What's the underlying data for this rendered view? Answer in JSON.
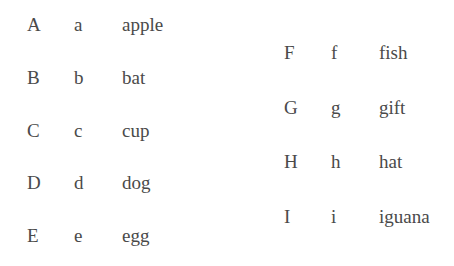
{
  "columns": [
    {
      "rows": [
        {
          "upper": "A",
          "lower": "a",
          "word": "apple"
        },
        {
          "upper": "B",
          "lower": "b",
          "word": "bat"
        },
        {
          "upper": "C",
          "lower": "c",
          "word": "cup"
        },
        {
          "upper": "D",
          "lower": "d",
          "word": "dog"
        },
        {
          "upper": "E",
          "lower": "e",
          "word": "egg"
        }
      ]
    },
    {
      "rows": [
        {
          "upper": "F",
          "lower": "f",
          "word": "fish"
        },
        {
          "upper": "G",
          "lower": "g",
          "word": "gift"
        },
        {
          "upper": "H",
          "lower": "h",
          "word": "hat"
        },
        {
          "upper": "I",
          "lower": "i",
          "word": "iguana"
        }
      ]
    }
  ]
}
